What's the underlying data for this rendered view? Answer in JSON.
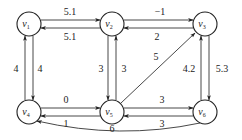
{
  "diagram": {
    "type": "directed-weighted-graph",
    "nodes": [
      {
        "id": "v1",
        "label": "v",
        "sub": "1",
        "x": 29,
        "y": 24
      },
      {
        "id": "v2",
        "label": "v",
        "sub": "2",
        "x": 112,
        "y": 24
      },
      {
        "id": "v3",
        "label": "v",
        "sub": "3",
        "x": 205,
        "y": 24
      },
      {
        "id": "v4",
        "label": "v",
        "sub": "4",
        "x": 29,
        "y": 112
      },
      {
        "id": "v5",
        "label": "v",
        "sub": "5",
        "x": 112,
        "y": 112
      },
      {
        "id": "v6",
        "label": "v",
        "sub": "6",
        "x": 205,
        "y": 112
      }
    ],
    "edges": [
      {
        "from": "v1",
        "to": "v2",
        "weight": "5.1"
      },
      {
        "from": "v2",
        "to": "v1",
        "weight": "5.1"
      },
      {
        "from": "v2",
        "to": "v3",
        "weight": "−1"
      },
      {
        "from": "v3",
        "to": "v2",
        "weight": "2"
      },
      {
        "from": "v4",
        "to": "v1",
        "weight": "4"
      },
      {
        "from": "v1",
        "to": "v4",
        "weight": "4"
      },
      {
        "from": "v2",
        "to": "v5",
        "weight": "3"
      },
      {
        "from": "v5",
        "to": "v2",
        "weight": "3"
      },
      {
        "from": "v6",
        "to": "v3",
        "weight": "4.2"
      },
      {
        "from": "v3",
        "to": "v6",
        "weight": "5.3"
      },
      {
        "from": "v4",
        "to": "v5",
        "weight": "0"
      },
      {
        "from": "v5",
        "to": "v4",
        "weight": "1"
      },
      {
        "from": "v5",
        "to": "v6",
        "weight": "3"
      },
      {
        "from": "v6",
        "to": "v5",
        "weight": "3"
      },
      {
        "from": "v5",
        "to": "v3",
        "weight": "5"
      },
      {
        "from": "v6",
        "to": "v4",
        "weight": "6"
      }
    ]
  }
}
